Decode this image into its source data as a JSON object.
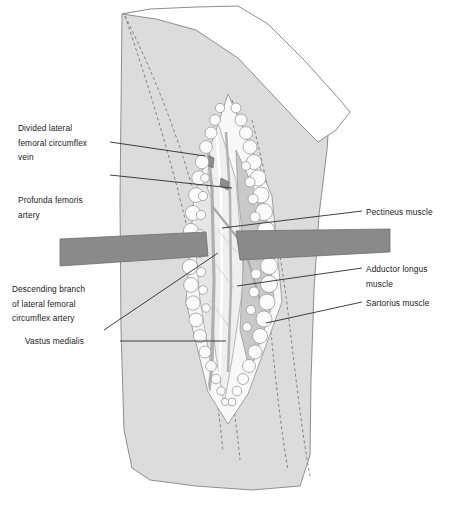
{
  "figure": {
    "width": 453,
    "height": 519,
    "background_color": "#ffffff"
  },
  "colors": {
    "skin_fill": "#dcdcdc",
    "skin_outline": "#8f8f8f",
    "drape_fill": "#ffffff",
    "drape_outline": "#8f8f8f",
    "fat_globule_fill": "#fbfbfb",
    "fat_globule_outline": "#9a9a9a",
    "retractor_fill": "#8a8a8a",
    "retractor_outline": "#6e6e6e",
    "wound_deep_fill": "#f6f6f6",
    "muscle_fill": "#c9c9c9",
    "vessel_fill": "#b4b4b4",
    "dashed_line": "#7a7a7a",
    "leader_line": "#2b2b2b",
    "label_text": "#1a1a1a"
  },
  "labels": {
    "left": [
      {
        "id": "divided-lateral-femoral-circumflex-vein",
        "text": "Divided lateral\nfemoral circumflex\nvein",
        "x": 18,
        "y": 121
      },
      {
        "id": "profunda-femoris-artery",
        "text": "Profunda femoris\nartery",
        "x": 18,
        "y": 193
      },
      {
        "id": "descending-branch-of-lateral-femoral-circumflex-artery",
        "text": "Descending branch\nof lateral femoral\ncircumflex artery",
        "x": 12,
        "y": 282
      },
      {
        "id": "vastus-medialis",
        "text": "Vastus medialis",
        "x": 25,
        "y": 337
      }
    ],
    "right": [
      {
        "id": "pectineus-muscle",
        "text": "Pectineus muscle",
        "x": 366,
        "y": 205
      },
      {
        "id": "adductor-longus-muscle",
        "text": "Adductor longus\nmuscle",
        "x": 366,
        "y": 262
      },
      {
        "id": "sartorius-muscle",
        "text": "Sartorius muscle",
        "x": 366,
        "y": 296
      }
    ]
  },
  "leader_lines": [
    {
      "id": "leader-divided-vein",
      "x1": 110,
      "y1": 142,
      "x2": 205,
      "y2": 156
    },
    {
      "id": "leader-profunda-artery",
      "x1": 110,
      "y1": 175,
      "x2": 232,
      "y2": 188
    },
    {
      "id": "leader-vastus-medialis",
      "x1": 120,
      "y1": 341,
      "x2": 226,
      "y2": 341
    },
    {
      "id": "leader-descending-branch",
      "x1": 104,
      "y1": 330,
      "x2": 218,
      "y2": 253
    },
    {
      "id": "leader-pectineus",
      "x1": 362,
      "y1": 211,
      "x2": 222,
      "y2": 228
    },
    {
      "id": "leader-adductor-longus",
      "x1": 362,
      "y1": 268,
      "x2": 237,
      "y2": 286
    },
    {
      "id": "leader-sartorius",
      "x1": 362,
      "y1": 302,
      "x2": 266,
      "y2": 323
    }
  ],
  "retractors": [
    {
      "id": "retractor-left",
      "label": "left retractor blade"
    },
    {
      "id": "retractor-right",
      "label": "right retractor blade"
    }
  ],
  "anatomy_structures": [
    "skin and subcutaneous fat",
    "surgical drape",
    "fat globules at wound margin",
    "vastus medialis",
    "sartorius muscle",
    "adductor longus muscle",
    "pectineus muscle",
    "profunda femoris artery",
    "descending branch of lateral femoral circumflex artery",
    "divided lateral femoral circumflex vein"
  ]
}
